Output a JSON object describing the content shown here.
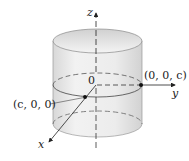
{
  "diagram": {
    "type": "3d-cylinder-coordinate-figure",
    "axes": {
      "x": {
        "label": "x"
      },
      "y": {
        "label": "y"
      },
      "z": {
        "label": "z"
      }
    },
    "origin_label": "0",
    "points": [
      {
        "label": "(c, 0, 0)",
        "coords": "c,0,0"
      },
      {
        "label": "(0, 0, c)",
        "coords": "0,0,c"
      }
    ],
    "colors": {
      "cylinder_fill": "#e8e8e8",
      "cylinder_shade": "#d4d4d4",
      "lines": "#333333",
      "points": "#111111"
    }
  }
}
